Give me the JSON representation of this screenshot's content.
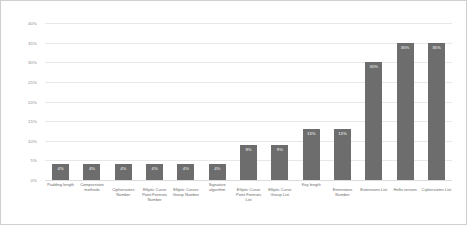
{
  "chart_data": {
    "type": "bar",
    "title": "",
    "subtitle": "",
    "xlabel": "",
    "ylabel": "",
    "ylim": [
      0,
      40
    ],
    "grid": true,
    "legend": "none",
    "orientation": "vertical",
    "value_label_position": "inside-top",
    "bar_color": "#6d6d6d",
    "background_color": "#ffffff",
    "gridline_color": "#e8e8e8",
    "y_ticks": [
      "0%",
      "5%",
      "10%",
      "15%",
      "20%",
      "25%",
      "30%",
      "35%",
      "40%"
    ],
    "y_tick_values": [
      0,
      5,
      10,
      15,
      20,
      25,
      30,
      35,
      40
    ],
    "categories": [
      "Padding length",
      "Compression methods",
      "Ciphersuites Number",
      "Elliptic Curve Point Formats Number",
      "Elliptic Curves Group Number",
      "Signature algorithm",
      "Elliptic Curve Point Formats List",
      "Elliptic Curve Group List",
      "Key length",
      "Extensions Number",
      "Extensions List",
      "Hello version",
      "Ciphersuites List"
    ],
    "values": [
      4,
      4,
      4,
      4,
      4,
      4,
      9,
      9,
      13,
      13,
      30,
      35,
      35
    ],
    "data_labels": [
      "4%",
      "4%",
      "4%",
      "4%",
      "4%",
      "4%",
      "9%",
      "9%",
      "13%",
      "13%",
      "30%",
      "35%",
      "35%"
    ],
    "label_rows": [
      0,
      0,
      1,
      1,
      1,
      0,
      1,
      1,
      0,
      1,
      1,
      1,
      1
    ]
  }
}
